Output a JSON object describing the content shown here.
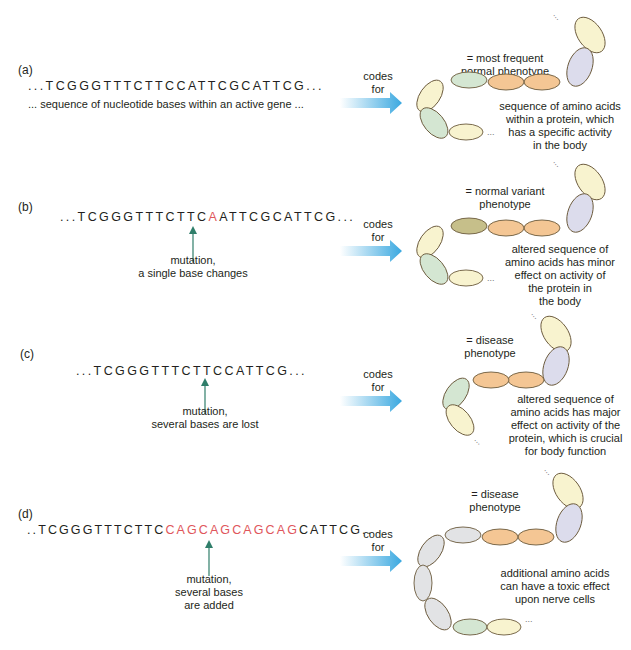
{
  "colors": {
    "mutation_red": "#e0565b",
    "arrow_green": "#2f7e6a",
    "arrow_blue": "#3aa8e0",
    "bead_yellow": "#f8f3cf",
    "bead_green": "#d4e6d2",
    "bead_orange": "#f4c694",
    "bead_lavender": "#dcdcec",
    "bead_olive": "#c6bf8a",
    "bead_grey": "#e2e3e5",
    "bead_outline": "#6b5a3c"
  },
  "panels": [
    {
      "label": "(a)",
      "sequence": {
        "prefix": "...TCGGGTTTCTTCCATTCGCATTCG...",
        "mutated": "",
        "suffix": ""
      },
      "caption": "... sequence of nucleotide bases within an active gene ...",
      "arrow_label_1": "codes",
      "arrow_label_2": "for",
      "phenotype_1": "= most frequent",
      "phenotype_2": "normal phenotype",
      "description": [
        "sequence of amino acids",
        "within a protein, which",
        "has a specific activity",
        "in the body"
      ]
    },
    {
      "label": "(b)",
      "sequence": {
        "prefix": "...TCGGGTTTCTTC",
        "mutated": "A",
        "suffix": "ATTCGCATTCG..."
      },
      "mutation_caption": [
        "mutation,",
        "a single base changes"
      ],
      "arrow_label_1": "codes",
      "arrow_label_2": "for",
      "phenotype_1": "= normal variant",
      "phenotype_2": "phenotype",
      "description": [
        "altered sequence of",
        "amino acids has minor",
        "effect on activity of",
        "the protein in",
        "the body"
      ]
    },
    {
      "label": "(c)",
      "sequence": {
        "prefix": "...TCGGGTTTCTTCCATTCG...",
        "mutated": "",
        "suffix": ""
      },
      "mutation_caption": [
        "mutation,",
        "several bases are lost"
      ],
      "arrow_label_1": "codes",
      "arrow_label_2": "for",
      "phenotype_1": "= disease",
      "phenotype_2": "phenotype",
      "description": [
        "altered sequence of",
        "amino acids has major",
        "effect on activity of the",
        "protein, which is crucial",
        "for body function"
      ]
    },
    {
      "label": "(d)",
      "sequence": {
        "prefix": "..TCGGGTTTCTTC",
        "mutated": "CAGCAGCAGCAG",
        "suffix": "CATTCG.."
      },
      "mutation_caption": [
        "mutation,",
        "several bases",
        "are added"
      ],
      "arrow_label_1": "codes",
      "arrow_label_2": "for",
      "phenotype_1": "= disease",
      "phenotype_2": "phenotype",
      "description": [
        "additional amino acids",
        "can have a toxic effect",
        "upon nerve cells"
      ]
    }
  ]
}
